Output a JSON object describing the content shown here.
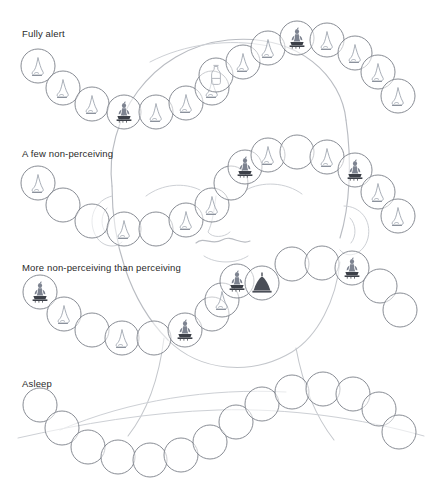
{
  "document": {
    "title": "Stages of alertness - mala bead diagram",
    "background_sketch": "pencil-outline-of-baby-head",
    "bead_diameter_px": 34,
    "colors": {
      "bead_stroke": "#7b7f88",
      "sketch_stroke": "#b9bcc2",
      "label_text": "#2a2a2a",
      "page_background": "#ffffff"
    }
  },
  "rows": [
    {
      "id": "fully-alert",
      "label": "Fully alert",
      "label_x": 22,
      "label_y": 28,
      "bead_count": 19,
      "beads": [
        {
          "x": 38,
          "y": 66,
          "icon": "nose-glyph"
        },
        {
          "x": 63,
          "y": 88,
          "icon": "nose-glyph"
        },
        {
          "x": 92,
          "y": 104,
          "icon": "nose-glyph"
        },
        {
          "x": 124,
          "y": 112,
          "icon": "buddha-glyph"
        },
        {
          "x": 156,
          "y": 112,
          "icon": "nose-glyph"
        },
        {
          "x": 186,
          "y": 103,
          "icon": "nose-glyph"
        },
        {
          "x": 212,
          "y": 88,
          "icon": "nose-glyph"
        },
        {
          "x": 216,
          "y": 75,
          "icon": "bottle-glyph"
        },
        {
          "x": 243,
          "y": 62,
          "icon": "nose-glyph"
        },
        {
          "x": 268,
          "y": 48,
          "icon": "nose-glyph"
        },
        {
          "x": 297,
          "y": 38,
          "icon": "buddha-glyph"
        },
        {
          "x": 327,
          "y": 40,
          "icon": "nose-glyph"
        },
        {
          "x": 355,
          "y": 53,
          "icon": "nose-glyph"
        },
        {
          "x": 378,
          "y": 72,
          "icon": "nose-glyph"
        },
        {
          "x": 398,
          "y": 96,
          "icon": "nose-glyph"
        }
      ]
    },
    {
      "id": "a-few-non-perceiving",
      "label": "A few non-perceiving",
      "label_x": 22,
      "label_y": 148,
      "bead_count": 15,
      "beads": [
        {
          "x": 38,
          "y": 183,
          "icon": "nose-glyph"
        },
        {
          "x": 63,
          "y": 205,
          "icon": "empty"
        },
        {
          "x": 92,
          "y": 221,
          "icon": "empty"
        },
        {
          "x": 124,
          "y": 229,
          "icon": "nose-glyph"
        },
        {
          "x": 156,
          "y": 229,
          "icon": "empty"
        },
        {
          "x": 186,
          "y": 220,
          "icon": "nose-glyph"
        },
        {
          "x": 212,
          "y": 205,
          "icon": "nose-glyph"
        },
        {
          "x": 231,
          "y": 183,
          "icon": "empty"
        },
        {
          "x": 245,
          "y": 167,
          "icon": "buddha-glyph"
        },
        {
          "x": 268,
          "y": 155,
          "icon": "nose-glyph"
        },
        {
          "x": 297,
          "y": 152,
          "icon": "empty"
        },
        {
          "x": 327,
          "y": 157,
          "icon": "nose-glyph"
        },
        {
          "x": 355,
          "y": 170,
          "icon": "buddha-glyph"
        },
        {
          "x": 378,
          "y": 192,
          "icon": "nose-glyph"
        },
        {
          "x": 398,
          "y": 216,
          "icon": "nose-glyph"
        }
      ]
    },
    {
      "id": "more-non-perceiving-than-perceiving",
      "label": "More non-perceiving than perceiving",
      "label_x": 22,
      "label_y": 262,
      "bead_count": 15,
      "beads": [
        {
          "x": 40,
          "y": 292,
          "icon": "buddha-glyph"
        },
        {
          "x": 64,
          "y": 314,
          "icon": "nose-glyph"
        },
        {
          "x": 92,
          "y": 330,
          "icon": "empty"
        },
        {
          "x": 122,
          "y": 338,
          "icon": "nose-glyph"
        },
        {
          "x": 154,
          "y": 338,
          "icon": "empty"
        },
        {
          "x": 185,
          "y": 330,
          "icon": "buddha-glyph"
        },
        {
          "x": 212,
          "y": 314,
          "icon": "empty"
        },
        {
          "x": 222,
          "y": 300,
          "icon": "nose-glyph"
        },
        {
          "x": 237,
          "y": 281,
          "icon": "buddha-glyph"
        },
        {
          "x": 262,
          "y": 283,
          "icon": "mound-glyph"
        },
        {
          "x": 292,
          "y": 264,
          "icon": "empty"
        },
        {
          "x": 322,
          "y": 263,
          "icon": "empty"
        },
        {
          "x": 352,
          "y": 268,
          "icon": "buddha-glyph"
        },
        {
          "x": 380,
          "y": 286,
          "icon": "empty"
        },
        {
          "x": 400,
          "y": 310,
          "icon": "empty"
        }
      ]
    },
    {
      "id": "asleep",
      "label": "Asleep",
      "label_x": 22,
      "label_y": 378,
      "bead_count": 15,
      "beads": [
        {
          "x": 40,
          "y": 405,
          "icon": "empty"
        },
        {
          "x": 62,
          "y": 428,
          "icon": "empty"
        },
        {
          "x": 88,
          "y": 447,
          "icon": "empty"
        },
        {
          "x": 118,
          "y": 457,
          "icon": "empty"
        },
        {
          "x": 150,
          "y": 460,
          "icon": "empty"
        },
        {
          "x": 181,
          "y": 455,
          "icon": "empty"
        },
        {
          "x": 210,
          "y": 442,
          "icon": "empty"
        },
        {
          "x": 236,
          "y": 422,
          "icon": "empty"
        },
        {
          "x": 262,
          "y": 404,
          "icon": "empty"
        },
        {
          "x": 292,
          "y": 392,
          "icon": "empty"
        },
        {
          "x": 323,
          "y": 389,
          "icon": "empty"
        },
        {
          "x": 353,
          "y": 394,
          "icon": "empty"
        },
        {
          "x": 379,
          "y": 409,
          "icon": "empty"
        },
        {
          "x": 399,
          "y": 432,
          "icon": "empty"
        }
      ]
    }
  ],
  "legend": {
    "icon_names": [
      "nose-glyph",
      "buddha-glyph",
      "bottle-glyph",
      "mound-glyph",
      "empty"
    ]
  }
}
